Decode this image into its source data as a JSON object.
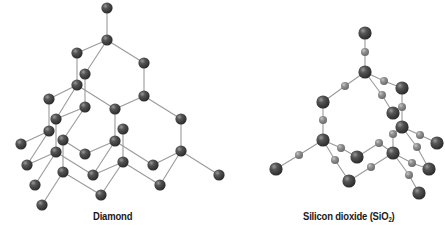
{
  "figure": {
    "colors": {
      "bond": "#9a9a9a",
      "large_atom": "#3c3c3c",
      "large_atom_highlight": "#8a8a8a",
      "small_atom": "#8c8c8c",
      "small_atom_highlight": "#c4c4c4",
      "background": "#ffffff",
      "caption": "#1a1a1a"
    },
    "panels": [
      {
        "id": "diamond",
        "caption": "Diamond",
        "atom_radius": 5.6,
        "atoms": [
          {
            "id": "A",
            "x": 107,
            "y": 8
          },
          {
            "id": "B",
            "x": 107,
            "y": 40
          },
          {
            "id": "C",
            "x": 77,
            "y": 53
          },
          {
            "id": "D",
            "x": 144,
            "y": 63
          },
          {
            "id": "E",
            "x": 85,
            "y": 74
          },
          {
            "id": "F",
            "x": 77,
            "y": 85
          },
          {
            "id": "G",
            "x": 144,
            "y": 96
          },
          {
            "id": "H",
            "x": 49,
            "y": 99
          },
          {
            "id": "I",
            "x": 85,
            "y": 107
          },
          {
            "id": "J",
            "x": 115,
            "y": 109
          },
          {
            "id": "Z",
            "x": 181,
            "y": 119
          },
          {
            "id": "K",
            "x": 56,
            "y": 119
          },
          {
            "id": "L",
            "x": 123,
            "y": 129
          },
          {
            "id": "M",
            "x": 49,
            "y": 131
          },
          {
            "id": "N",
            "x": 63,
            "y": 140
          },
          {
            "id": "O",
            "x": 115,
            "y": 141
          },
          {
            "id": "P",
            "x": 21,
            "y": 144
          },
          {
            "id": "AA",
            "x": 181,
            "y": 151
          },
          {
            "id": "Q",
            "x": 56,
            "y": 152
          },
          {
            "id": "R",
            "x": 85,
            "y": 154
          },
          {
            "id": "V",
            "x": 123,
            "y": 162
          },
          {
            "id": "AB",
            "x": 153,
            "y": 165
          },
          {
            "id": "S",
            "x": 27,
            "y": 165
          },
          {
            "id": "T",
            "x": 63,
            "y": 172
          },
          {
            "id": "U",
            "x": 93,
            "y": 175
          },
          {
            "id": "AC",
            "x": 219,
            "y": 175
          },
          {
            "id": "W",
            "x": 35,
            "y": 185
          },
          {
            "id": "AD",
            "x": 160,
            "y": 185
          },
          {
            "id": "X",
            "x": 101,
            "y": 195
          },
          {
            "id": "Y",
            "x": 42,
            "y": 205
          }
        ],
        "bonds": [
          [
            "A",
            "B"
          ],
          [
            "B",
            "C"
          ],
          [
            "B",
            "D"
          ],
          [
            "B",
            "E"
          ],
          [
            "C",
            "F"
          ],
          [
            "D",
            "G"
          ],
          [
            "E",
            "I"
          ],
          [
            "F",
            "H"
          ],
          [
            "F",
            "J"
          ],
          [
            "F",
            "K"
          ],
          [
            "G",
            "J"
          ],
          [
            "G",
            "Z"
          ],
          [
            "H",
            "M"
          ],
          [
            "I",
            "K"
          ],
          [
            "I",
            "N"
          ],
          [
            "J",
            "O"
          ],
          [
            "Z",
            "AA"
          ],
          [
            "K",
            "Q"
          ],
          [
            "L",
            "V"
          ],
          [
            "M",
            "P"
          ],
          [
            "M",
            "S"
          ],
          [
            "N",
            "R"
          ],
          [
            "N",
            "T"
          ],
          [
            "O",
            "R"
          ],
          [
            "O",
            "AB"
          ],
          [
            "O",
            "U"
          ],
          [
            "AA",
            "AB"
          ],
          [
            "AA",
            "AC"
          ],
          [
            "AA",
            "AD"
          ],
          [
            "Q",
            "S"
          ],
          [
            "Q",
            "U"
          ],
          [
            "Q",
            "W"
          ],
          [
            "V",
            "AD"
          ],
          [
            "V",
            "U"
          ],
          [
            "V",
            "X"
          ],
          [
            "T",
            "X"
          ],
          [
            "T",
            "Y"
          ]
        ]
      },
      {
        "id": "silicon-dioxide",
        "caption": "Silicon dioxide (SiO",
        "caption_subscript": "2",
        "caption_suffix": ")",
        "large_radius": 6.6,
        "small_radius": 4.0,
        "atoms": [
          {
            "id": "s1",
            "x": 365,
            "y": 33,
            "size": "large"
          },
          {
            "id": "s2",
            "x": 365,
            "y": 72,
            "size": "large"
          },
          {
            "id": "s3",
            "x": 402,
            "y": 88,
            "size": "large"
          },
          {
            "id": "s4",
            "x": 323,
            "y": 102,
            "size": "large"
          },
          {
            "id": "s5",
            "x": 393,
            "y": 113,
            "size": "large"
          },
          {
            "id": "s6",
            "x": 402,
            "y": 127,
            "size": "large"
          },
          {
            "id": "s7",
            "x": 323,
            "y": 140,
            "size": "large"
          },
          {
            "id": "s8",
            "x": 437,
            "y": 143,
            "size": "large"
          },
          {
            "id": "s9",
            "x": 357,
            "y": 157,
            "size": "large"
          },
          {
            "id": "s10",
            "x": 393,
            "y": 153,
            "size": "large"
          },
          {
            "id": "s11",
            "x": 276,
            "y": 169,
            "size": "large"
          },
          {
            "id": "s12",
            "x": 429,
            "y": 169,
            "size": "large"
          },
          {
            "id": "s13",
            "x": 349,
            "y": 181,
            "size": "large"
          },
          {
            "id": "s14",
            "x": 419,
            "y": 193,
            "size": "large"
          },
          {
            "id": "o1",
            "x": 365,
            "y": 52,
            "size": "small"
          },
          {
            "id": "o2",
            "x": 384,
            "y": 81,
            "size": "small"
          },
          {
            "id": "o3",
            "x": 345,
            "y": 86,
            "size": "small"
          },
          {
            "id": "o4",
            "x": 382,
            "y": 95,
            "size": "small"
          },
          {
            "id": "o5",
            "x": 402,
            "y": 107,
            "size": "small"
          },
          {
            "id": "o6",
            "x": 323,
            "y": 120,
            "size": "small"
          },
          {
            "id": "o7",
            "x": 420,
            "y": 135,
            "size": "small"
          },
          {
            "id": "o8",
            "x": 393,
            "y": 134,
            "size": "small"
          },
          {
            "id": "o9",
            "x": 341,
            "y": 148,
            "size": "small"
          },
          {
            "id": "o10",
            "x": 379,
            "y": 143,
            "size": "small"
          },
          {
            "id": "o11",
            "x": 417,
            "y": 147,
            "size": "small"
          },
          {
            "id": "o12",
            "x": 299,
            "y": 155,
            "size": "small"
          },
          {
            "id": "o13",
            "x": 335,
            "y": 160,
            "size": "small"
          },
          {
            "id": "o14",
            "x": 412,
            "y": 163,
            "size": "small"
          },
          {
            "id": "o15",
            "x": 371,
            "y": 167,
            "size": "small"
          },
          {
            "id": "o16",
            "x": 409,
            "y": 175,
            "size": "small"
          }
        ],
        "bonds": [
          [
            "s1",
            "o1"
          ],
          [
            "o1",
            "s2"
          ],
          [
            "s2",
            "o2"
          ],
          [
            "o2",
            "s3"
          ],
          [
            "s2",
            "o3"
          ],
          [
            "o3",
            "s4"
          ],
          [
            "s2",
            "o4"
          ],
          [
            "o4",
            "s5"
          ],
          [
            "s3",
            "o5"
          ],
          [
            "o5",
            "s6"
          ],
          [
            "s4",
            "o6"
          ],
          [
            "o6",
            "s7"
          ],
          [
            "s6",
            "o7"
          ],
          [
            "o7",
            "s8"
          ],
          [
            "s6",
            "o8"
          ],
          [
            "o8",
            "s10"
          ],
          [
            "s7",
            "o9"
          ],
          [
            "o9",
            "s9"
          ],
          [
            "s9",
            "o10"
          ],
          [
            "o10",
            "s10"
          ],
          [
            "s6",
            "o11"
          ],
          [
            "o11",
            "s12"
          ],
          [
            "s7",
            "o12"
          ],
          [
            "o12",
            "s11"
          ],
          [
            "s7",
            "o13"
          ],
          [
            "o13",
            "s13"
          ],
          [
            "s10",
            "o14"
          ],
          [
            "o14",
            "s12"
          ],
          [
            "s13",
            "o15"
          ],
          [
            "o15",
            "s10"
          ],
          [
            "s10",
            "o16"
          ],
          [
            "o16",
            "s14"
          ]
        ]
      }
    ]
  }
}
